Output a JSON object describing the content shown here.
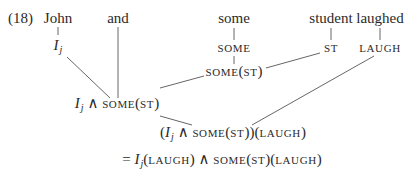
{
  "example_number": "(18)",
  "words": {
    "john": "John",
    "and": "and",
    "some": "some",
    "student": "student",
    "laughed": "laughed"
  },
  "lexical": {
    "john": {
      "base": "I",
      "sub": "j"
    },
    "some": "SOME",
    "student": "ST",
    "laughed": "LAUGH"
  },
  "intermediate": {
    "some_st": {
      "pred": "SOME",
      "open": "(",
      "arg": "ST",
      "close": ")"
    },
    "conj": {
      "base": "I",
      "sub": "j",
      "op": " ∧ ",
      "pred": "SOME",
      "open": "(",
      "arg": "ST",
      "close": ")"
    }
  },
  "result": {
    "open1": "(",
    "base": "I",
    "sub": "j",
    "op": " ∧ ",
    "pred": "SOME",
    "open2": "(",
    "arg": "ST",
    "close2": "))",
    "open3": "(",
    "arg2": "LAUGH",
    "close3": ")"
  },
  "equation": {
    "eq": "= ",
    "base": "I",
    "sub": "j",
    "open1": "(",
    "arg1": "LAUGH",
    "close1": ")",
    "op": " ∧ ",
    "pred": "SOME",
    "open2": "(",
    "arg2": "ST",
    "close2": ")",
    "open3": "(",
    "arg3": "LAUGH",
    "close3": ")"
  },
  "colors": {
    "text": "#2a2a2a",
    "edge": "#555555",
    "background": "#ffffff"
  }
}
